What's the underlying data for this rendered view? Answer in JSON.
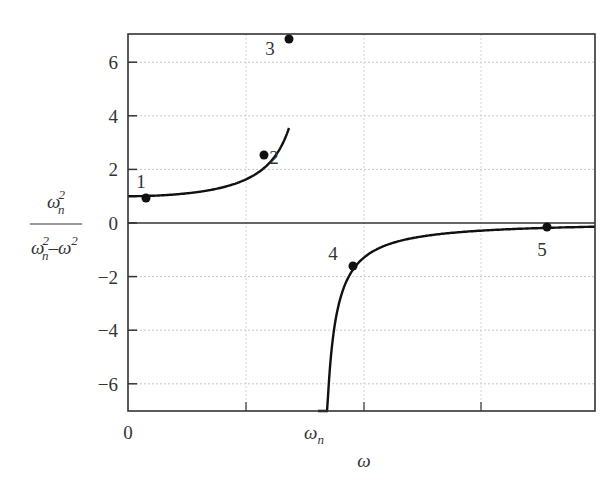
{
  "chart_data": {
    "type": "line",
    "title": "",
    "xlabel": "ω",
    "ylabel": "ω_n² / (ω_n² − ω²)",
    "ylabel_parts": {
      "num_base": "ω",
      "num_sub": "n",
      "num_sup": "2",
      "den_a_base": "ω",
      "den_a_sub": "n",
      "den_a_sup": "2",
      "den_op": "–",
      "den_b_base": "ω",
      "den_b_sup": "2"
    },
    "xlim": [
      0,
      2.46
    ],
    "ylim": [
      -7,
      7
    ],
    "grid": true,
    "x_ticks": [
      {
        "value": 0,
        "label": "0"
      },
      {
        "value": 1,
        "label": "ω_n",
        "base": "ω",
        "sub": "n"
      }
    ],
    "y_ticks": [
      {
        "value": 6,
        "label": "6"
      },
      {
        "value": 4,
        "label": "4"
      },
      {
        "value": 2,
        "label": "2"
      },
      {
        "value": 0,
        "label": "0"
      },
      {
        "value": -2,
        "label": "−2"
      },
      {
        "value": -4,
        "label": "−4"
      },
      {
        "value": -6,
        "label": "−6"
      }
    ],
    "asymptote_x": 1,
    "series": [
      {
        "name": "ω_n²/(ω_n²−ω²)",
        "function": "1/(1-(ω/ω_n)^2)"
      }
    ],
    "points": [
      {
        "label": "1",
        "x": 0.09,
        "y": 1.0
      },
      {
        "label": "2",
        "x": 0.72,
        "y": 2.5
      },
      {
        "label": "3",
        "x": 0.85,
        "y": 6.9
      },
      {
        "label": "4",
        "x": 1.18,
        "y": -1.6
      },
      {
        "label": "5",
        "x": 2.2,
        "y": -0.1
      }
    ]
  }
}
